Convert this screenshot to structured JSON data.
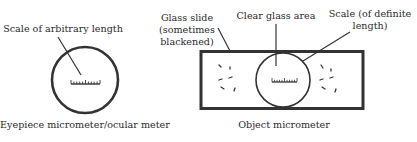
{
  "left_figure": {
    "scale_label": "Scale of arbitrary length",
    "caption": "Eyepiece micrometer/ocular meter"
  },
  "right_figure": {
    "glass_slide_label_line1": "Glass slide",
    "glass_slide_label_line2": "(sometimes",
    "glass_slide_label_line3": "blackened)",
    "clear_glass_label": "Clear glass area",
    "scale_label_line1": "Scale (of definite",
    "scale_label_line2": "length)",
    "caption": "Object micrometer"
  },
  "colors": {
    "stroke": "#333333",
    "text": "#2a2a2a",
    "background": "#ffffff"
  }
}
